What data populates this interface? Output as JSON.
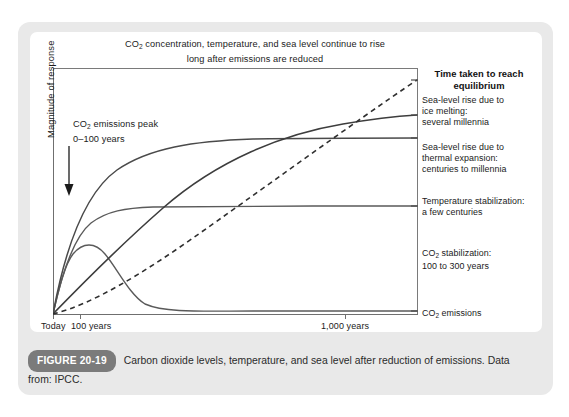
{
  "figure": {
    "badge": "FIGURE 20-19",
    "caption": "Carbon dioxide levels, temperature, and sea level after reduction of emissions. Data from: IPCC."
  },
  "chart_data": {
    "type": "line",
    "title_line1_a": "CO",
    "title_line1_sub": "2",
    "title_line1_b": " concentration, temperature, and sea level continue to rise",
    "title_line2": "long after emissions are reduced",
    "title": "CO2 concentration, temperature, and sea level continue to rise long after emissions are reduced",
    "xlabel": "",
    "ylabel": "Magnitude of response",
    "x_ticks": [
      "Today",
      "100 years",
      "1,000 years"
    ],
    "x_tick_positions": [
      0,
      27,
      292
    ],
    "y_ticks": [],
    "grid": false,
    "legend_position": "right",
    "annotation": {
      "line1_a": "CO",
      "line1_sub": "2",
      "line1_b": " emissions peak",
      "line2": "0–100 years",
      "text": "CO2 emissions peak 0-100 years",
      "arrow": "down-arrow"
    },
    "series": [
      {
        "name": "Sea-level rise due to ice melting",
        "style": "dashed",
        "equilibrium": "several millennia",
        "path": "M 0,246 C 40,236 90,205 140,170 C 200,128 300,55 364,12"
      },
      {
        "name": "Sea-level rise due to thermal expansion",
        "style": "solid",
        "equilibrium": "centuries to millennia",
        "path": "M 0,246 C 30,215 70,175 110,140 C 165,92 230,66 290,56 C 325,50 348,48 364,47"
      },
      {
        "name": "Temperature stabilization",
        "style": "solid",
        "equilibrium": "a few centuries",
        "path": "M 0,246 C 14,170 36,122 64,102 C 96,80 140,73 200,71 C 260,70 320,70 364,70"
      },
      {
        "name": "CO2 stabilization",
        "style": "solid",
        "equilibrium": "100 to 300 years",
        "path": "M 0,246 C 10,200 22,168 38,155 C 54,143 72,140 100,139 C 160,138 280,138 364,138"
      },
      {
        "name": "CO2 emissions",
        "style": "solid",
        "equilibrium": "",
        "path": "M 0,246 C 6,220 12,196 20,186 C 30,174 42,174 52,186 C 64,200 76,226 92,236 C 112,245 150,243 200,243 C 270,243 320,243 364,243"
      }
    ],
    "legend": {
      "title_line1": "Time taken to reach",
      "title_line2": "equilibrium",
      "items": [
        {
          "id": "ice-melting",
          "lines": [
            "Sea-level rise due to",
            "ice melting:",
            "several millennia"
          ],
          "y": 11,
          "tick_y": 12
        },
        {
          "id": "thermal-expansion",
          "lines": [
            "Sea-level rise due to",
            "thermal expansion:",
            "centuries to millennia"
          ],
          "y": 49,
          "tick_y": 47
        },
        {
          "id": "temperature-stabilization",
          "lines": [
            "Temperature stabilization:",
            "a few centuries"
          ],
          "y": 96,
          "tick_y": 70
        },
        {
          "id": "co2-stabilization",
          "lines_a": "CO",
          "lines_sub": "2",
          "lines_b": " stabilization:",
          "lines": [
            "CO2 stabilization:",
            "100 to 300 years"
          ],
          "line2": "100 to 300 years",
          "y": 145,
          "tick_y": 138
        },
        {
          "id": "co2-emissions",
          "lines_a": "CO",
          "lines_sub": "2",
          "lines_b": " emissions",
          "lines": [
            "CO2 emissions"
          ],
          "y": 207,
          "tick_y": 243
        }
      ]
    }
  }
}
